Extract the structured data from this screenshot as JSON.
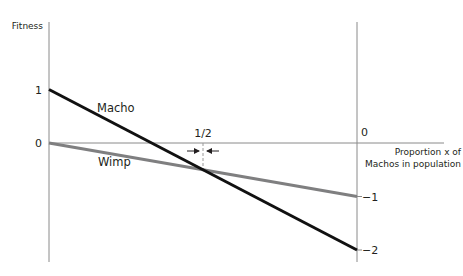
{
  "chart_data": {
    "type": "line",
    "title": "",
    "xlabel": [
      "Proportion x of",
      "Machos in population"
    ],
    "ylabel": "Fitness",
    "xlim": [
      0,
      1
    ],
    "ylim": [
      -2,
      1
    ],
    "grid": false,
    "legend": "inline labels",
    "series": [
      {
        "name": "Macho",
        "x": [
          0,
          1
        ],
        "y": [
          1,
          -2
        ],
        "color": "#111111"
      },
      {
        "name": "Wimp",
        "x": [
          0,
          1
        ],
        "y": [
          0,
          -1
        ],
        "color": "#7f7f80"
      }
    ],
    "left_axis_ticks": [
      {
        "value": 1,
        "label": "1"
      },
      {
        "value": 0,
        "label": "0"
      }
    ],
    "right_axis_ticks": [
      {
        "value": 0,
        "label": "0"
      },
      {
        "value": -1,
        "label": "−1"
      },
      {
        "value": -2,
        "label": "−2"
      }
    ],
    "annotations": [
      {
        "type": "equilibrium-marker",
        "x": 0.5,
        "label": "1/2",
        "arrows": "converging"
      }
    ],
    "colors": {
      "axis": "#8a8a8a",
      "text": "#231f20"
    }
  }
}
